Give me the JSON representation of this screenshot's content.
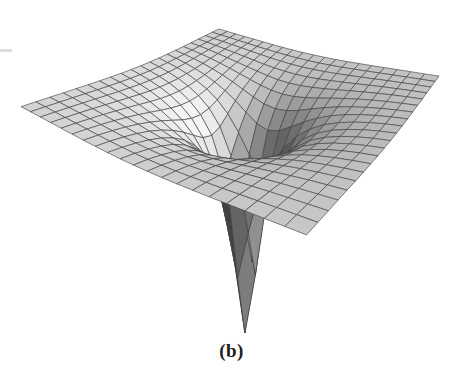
{
  "figure": {
    "label": "(b)"
  },
  "chart_data": {
    "type": "surface",
    "title": "",
    "function": {
      "formula": "z = -k / sqrt(x^2 + y^2), clipped below at z_clip",
      "k": 0.55,
      "z_clip": -3.9
    },
    "domain": {
      "x": [
        -2,
        2
      ],
      "y": [
        -2,
        2
      ]
    },
    "grid": {
      "cells_x": 20,
      "cells_y": 20
    },
    "view": {
      "azimuth_deg": 215,
      "elevation_deg": 27,
      "distance": 6.5,
      "target_z": -1
    },
    "lighting": {
      "direction": [
        0.62,
        -0.58,
        0.53
      ],
      "ambient": 0.22,
      "diffuse": 0.75,
      "power": 2.0
    },
    "style": {
      "background": "#ffffff",
      "mesh_line_color": "#3f3f3f",
      "mesh_line_width": 0.7,
      "mesh_line_opacity": 0.9
    },
    "plot_rect": {
      "x": 21,
      "y": 29,
      "width": 418,
      "height": 304
    },
    "axes": "none",
    "legend": "none"
  },
  "artifacts": {
    "left_margin_dash_color": "#dcdcdc"
  }
}
